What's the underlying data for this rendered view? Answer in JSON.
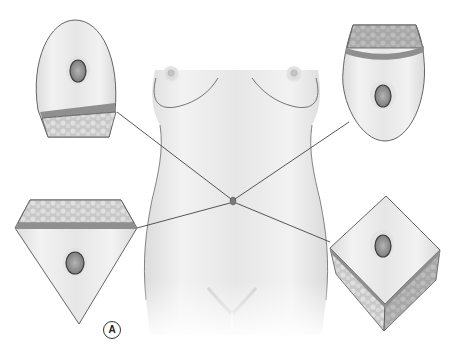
{
  "figure": {
    "panel_label": "A",
    "colors": {
      "background": "#ffffff",
      "skin_fill": "#ececec",
      "skin_shade": "#d6d6d6",
      "outline": "#555555",
      "leader_line": "#444444",
      "dermis_band": "#8f8f8f",
      "fat_layer": "#c4c4c4",
      "umbilicus_fill": "#9a9a9a",
      "umbilicus_rim": "#3a3a3a"
    },
    "insets": [
      {
        "id": "top-left",
        "shape": "rounded-dome-with-fat-band-bottom",
        "position": "top-left"
      },
      {
        "id": "top-right",
        "shape": "rounded-dome-with-fat-band-top",
        "position": "top-right"
      },
      {
        "id": "bottom-left",
        "shape": "inverted-triangle-with-fat-band-top",
        "position": "bottom-left"
      },
      {
        "id": "bottom-right",
        "shape": "cube-diamond-with-fat-sides",
        "position": "bottom-right"
      }
    ],
    "umbilicus_point": {
      "x": 233,
      "y": 201
    }
  }
}
